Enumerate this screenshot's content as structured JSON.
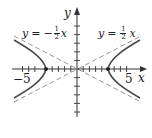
{
  "figure": {
    "type": "hyperbola-with-asymptotes",
    "axes": {
      "x_label": "x",
      "y_label": "y",
      "tick_labels": {
        "neg": "−5",
        "pos": "5"
      },
      "x_ticks": [
        -11,
        -10,
        -9,
        -8,
        -7,
        -6,
        -5,
        -4,
        -3,
        -2,
        -1,
        1,
        2,
        3,
        4,
        5,
        6,
        7,
        8,
        9,
        10
      ],
      "y_ticks": [
        -7,
        -6,
        -5,
        -4,
        -3,
        -2,
        -1,
        1,
        2,
        3,
        4,
        5,
        6,
        7
      ]
    },
    "asymptote_left": {
      "lhs": "y",
      "eq": "=",
      "sign": "−",
      "num": "1",
      "den": "2",
      "var": "x"
    },
    "asymptote_right": {
      "lhs": "y",
      "eq": "=",
      "sign": "",
      "num": "1",
      "den": "2",
      "var": "x"
    },
    "vertices": [
      [
        -5,
        0
      ],
      [
        5,
        0
      ]
    ],
    "colors": {
      "curve": "#4a4a4a",
      "asymptote": "#8a8a8a",
      "axis": "#333333"
    }
  }
}
